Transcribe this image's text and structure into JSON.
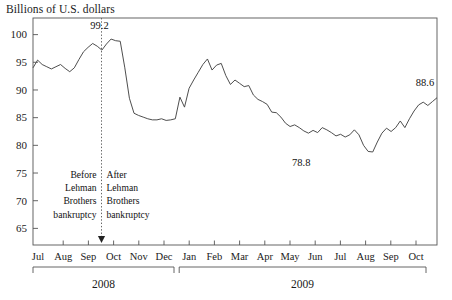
{
  "chart_data": {
    "type": "line",
    "title": "Billions of U.S. dollars",
    "xlabel": "",
    "ylabel": "Billions of U.S. dollars",
    "ylim": [
      62,
      103
    ],
    "yticks": [
      65,
      70,
      75,
      80,
      85,
      90,
      95,
      100
    ],
    "grid": false,
    "legend": null,
    "axis_color": "#555555",
    "line_color": "#444444",
    "x_tick_labels": [
      "Jul",
      "Aug",
      "Sep",
      "Oct",
      "Nov",
      "Dec",
      "Jan",
      "Feb",
      "Mar",
      "Apr",
      "May",
      "Jun",
      "Jul",
      "Aug",
      "Sep",
      "Oct"
    ],
    "year_groups": [
      {
        "label": "2008",
        "start_month": "Jul",
        "end_month": "Dec"
      },
      {
        "label": "2009",
        "start_month": "Jan",
        "end_month": "Oct"
      }
    ],
    "annotations": [
      {
        "name": "peak-label",
        "text": "99.2",
        "value": 99.2,
        "x_index": 11
      },
      {
        "name": "trough-label",
        "text": "78.8",
        "value": 78.8,
        "x_index": 58
      },
      {
        "name": "final-label",
        "text": "88.6",
        "value": 88.6,
        "x_index": 69
      },
      {
        "name": "before-lehman-note",
        "lines": [
          "Before",
          "Lehman",
          "Brothers",
          "bankruptcy"
        ]
      },
      {
        "name": "after-lehman-note",
        "lines": [
          "After",
          "Lehman",
          "Brothers",
          "bankruptcy"
        ]
      },
      {
        "name": "event-marker",
        "text": "Lehman Brothers bankruptcy",
        "x_position_month": "Sep 2008"
      }
    ],
    "series": [
      {
        "name": "Commercial and industrial loans",
        "values": [
          94.0,
          95.4,
          94.6,
          94.2,
          93.8,
          94.2,
          94.6,
          93.9,
          93.3,
          94.0,
          95.5,
          96.9,
          97.7,
          98.4,
          97.9,
          97.2,
          98.3,
          99.2,
          98.9,
          98.8,
          94.0,
          88.5,
          85.8,
          85.4,
          85.1,
          84.8,
          84.6,
          84.6,
          84.8,
          84.5,
          84.6,
          84.8,
          88.7,
          86.9,
          90.3,
          91.8,
          93.2,
          94.6,
          95.6,
          93.6,
          94.5,
          94.8,
          92.6,
          91.0,
          91.8,
          91.2,
          90.6,
          90.8,
          89.1,
          88.3,
          87.9,
          87.4,
          86.0,
          85.9,
          85.1,
          84.0,
          83.4,
          83.7,
          83.2,
          82.6,
          82.2,
          82.7,
          82.3,
          83.2,
          82.8,
          82.3,
          81.7,
          82.0,
          81.5,
          81.9,
          82.8,
          81.9,
          80.0,
          78.9,
          78.8,
          80.6,
          82.2,
          83.1,
          82.5,
          83.2,
          84.4,
          83.2,
          84.8,
          86.2,
          87.3,
          87.8,
          87.2,
          87.9,
          88.6
        ]
      }
    ]
  },
  "plot_geometry": {
    "left": 33,
    "right": 437,
    "top": 18,
    "bottom": 245,
    "month_step_px": 25.2
  }
}
